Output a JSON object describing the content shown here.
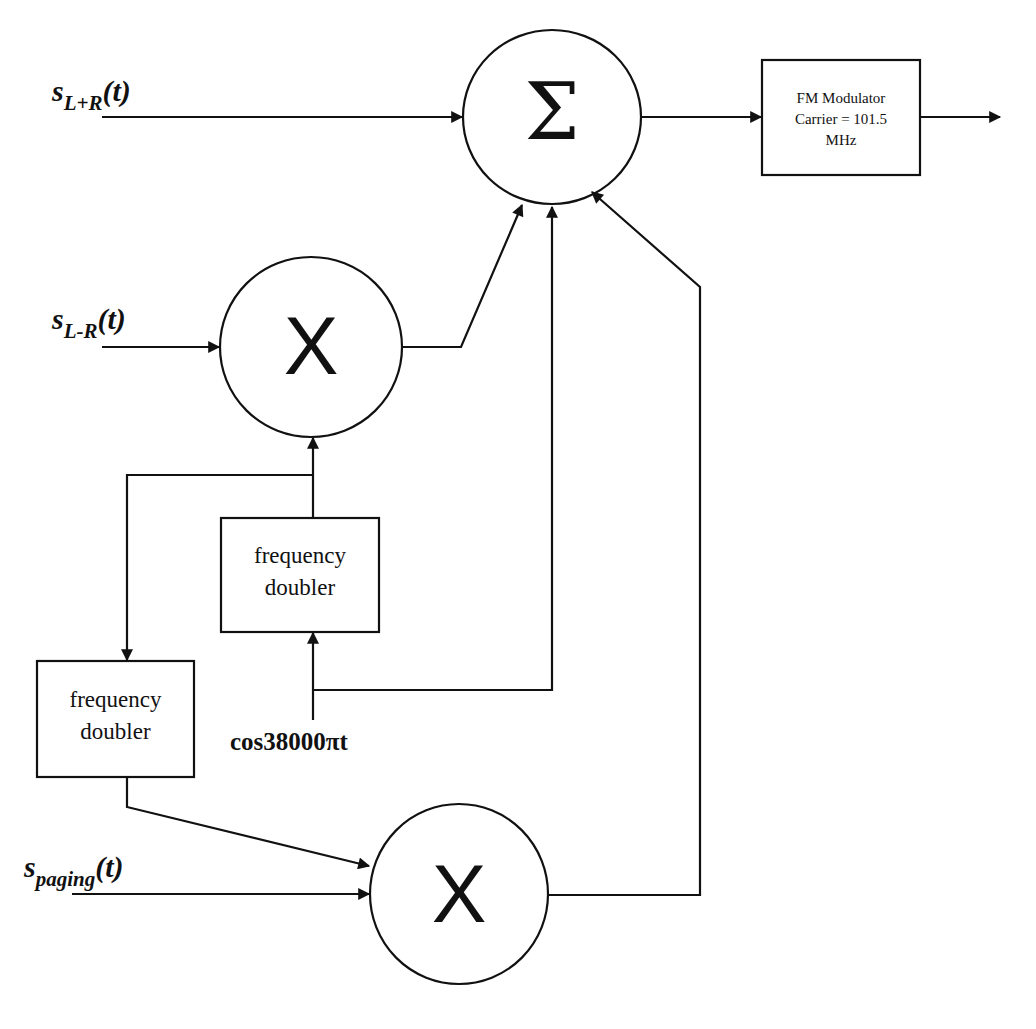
{
  "diagram": {
    "inputs": [
      {
        "id": "s_lpr",
        "base": "s",
        "subscript": "L+R",
        "suffix": "(t)"
      },
      {
        "id": "s_lmr",
        "base": "s",
        "subscript": "L-R",
        "suffix": "(t)"
      },
      {
        "id": "s_paging",
        "base": "s",
        "subscript": "paging",
        "suffix": "(t)"
      }
    ],
    "carrier_label": "cos38000πt",
    "summer": {
      "symbol": "Σ"
    },
    "multipliers": [
      {
        "id": "mult_top",
        "symbol": "X"
      },
      {
        "id": "mult_bottom",
        "symbol": "X"
      }
    ],
    "blocks": {
      "fm_modulator": {
        "line1": "FM Modulator",
        "line2": "Carrier = 101.5",
        "line3": "MHz"
      },
      "doubler_upper": {
        "line1": "frequency",
        "line2": "doubler"
      },
      "doubler_lower": {
        "line1": "frequency",
        "line2": "doubler"
      }
    },
    "colors": {
      "line": "#111111",
      "background": "#ffffff"
    }
  }
}
